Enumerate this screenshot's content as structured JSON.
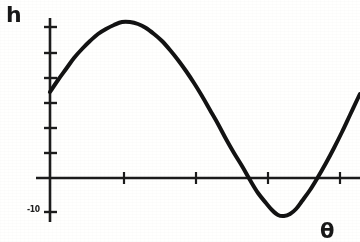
{
  "figure": {
    "background_color": "#fdfdfc",
    "ink_color": "#1a1a1a"
  },
  "labels": {
    "y_axis": "h",
    "x_axis": "θ",
    "y_min_tick": "-10"
  },
  "chart_data": {
    "type": "line",
    "title": "",
    "subtitle": "",
    "xlabel": "θ",
    "ylabel": "h",
    "grid": false,
    "legend": null,
    "axis_origin_px": {
      "x": 50,
      "y": 178
    },
    "x_tick_positions_px": [
      50,
      124,
      196,
      268,
      340
    ],
    "y_tick_positions_px": [
      27,
      53,
      78,
      103,
      128,
      153,
      178,
      212
    ],
    "y_tick_labels": [
      "",
      "",
      "",
      "",
      "",
      "",
      "",
      "-10"
    ],
    "xlim": [
      0,
      360
    ],
    "ylim": [
      -10,
      14
    ],
    "series": [
      {
        "name": "h(θ)",
        "color": "#151515",
        "line_width_px": 4,
        "points_px": [
          [
            50,
            92
          ],
          [
            58,
            80
          ],
          [
            66,
            69
          ],
          [
            74,
            58
          ],
          [
            82,
            49
          ],
          [
            90,
            41
          ],
          [
            98,
            34
          ],
          [
            106,
            29
          ],
          [
            114,
            25
          ],
          [
            122,
            22
          ],
          [
            130,
            22
          ],
          [
            138,
            24
          ],
          [
            146,
            28
          ],
          [
            154,
            34
          ],
          [
            162,
            41
          ],
          [
            170,
            50
          ],
          [
            178,
            60
          ],
          [
            186,
            71
          ],
          [
            194,
            83
          ],
          [
            202,
            96
          ],
          [
            210,
            110
          ],
          [
            218,
            124
          ],
          [
            226,
            139
          ],
          [
            234,
            153
          ],
          [
            242,
            166
          ],
          [
            250,
            180
          ],
          [
            258,
            193
          ],
          [
            266,
            203
          ],
          [
            272,
            210
          ],
          [
            278,
            215
          ],
          [
            284,
            216
          ],
          [
            290,
            214
          ],
          [
            296,
            209
          ],
          [
            302,
            201
          ],
          [
            310,
            190
          ],
          [
            318,
            177
          ],
          [
            326,
            163
          ],
          [
            334,
            148
          ],
          [
            342,
            132
          ],
          [
            350,
            115
          ],
          [
            358,
            98
          ],
          [
            360,
            94
          ]
        ],
        "key_features": {
          "start_value_px": [
            50,
            92
          ],
          "maximum_px": [
            126,
            22
          ],
          "zero_crossing_descending_px": [
            237,
            178
          ],
          "minimum_px": [
            281,
            216
          ],
          "zero_crossing_ascending_px": [
            318,
            178
          ],
          "end_value_px": [
            360,
            94
          ]
        }
      }
    ]
  }
}
